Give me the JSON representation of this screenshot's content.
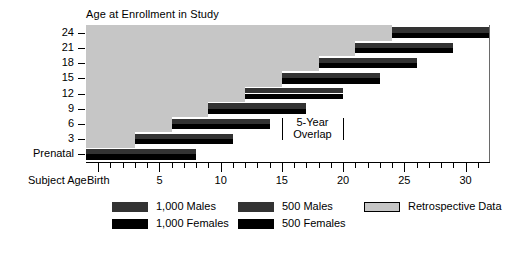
{
  "chart_data": {
    "type": "bar",
    "title": "",
    "ylabel": "Age at Enrollment in Study",
    "xlabel": "Subject Age",
    "xlim": [
      -1,
      32
    ],
    "x_major_ticks": [
      0,
      5,
      10,
      15,
      20,
      25,
      30
    ],
    "x_major_labels": [
      "Birth",
      "5",
      "10",
      "15",
      "20",
      "25",
      "30"
    ],
    "x_minor_step": 1,
    "y_categories": [
      "Prenatal",
      "3",
      "6",
      "9",
      "12",
      "15",
      "18",
      "21",
      "24"
    ],
    "grid": false,
    "legend_position": "below",
    "annotations": [
      {
        "text": "5-Year Overlap",
        "x_start": 15,
        "x_end": 20,
        "y_row": "3"
      }
    ],
    "series": [
      {
        "name": "Males",
        "color": "#333333",
        "position": "upper half of each cohort bar"
      },
      {
        "name": "Females",
        "color": "#000000",
        "position": "lower half of each cohort bar"
      },
      {
        "name": "Retrospective Data",
        "color": "#c6c6c6",
        "position": "background region left of each cohort bar"
      }
    ],
    "cohorts": [
      {
        "enrollment_age": "Prenatal",
        "age_start": -1,
        "age_end": 8,
        "n": 1000
      },
      {
        "enrollment_age": "3",
        "age_start": 3,
        "age_end": 11,
        "n": 1000
      },
      {
        "enrollment_age": "6",
        "age_start": 6,
        "age_end": 14,
        "n": 1000
      },
      {
        "enrollment_age": "9",
        "age_start": 9,
        "age_end": 17,
        "n": 1000
      },
      {
        "enrollment_age": "12",
        "age_start": 12,
        "age_end": 20,
        "n": 1000
      },
      {
        "enrollment_age": "15",
        "age_start": 15,
        "age_end": 23,
        "n": 500
      },
      {
        "enrollment_age": "18",
        "age_start": 18,
        "age_end": 26,
        "n": 500
      },
      {
        "enrollment_age": "21",
        "age_start": 21,
        "age_end": 29,
        "n": 500
      },
      {
        "enrollment_age": "24",
        "age_start": 24,
        "age_end": 32,
        "n": 500
      }
    ]
  },
  "axes": {
    "y_title": "Age at Enrollment in Study",
    "x_title": "Subject Age",
    "y_labels": [
      "24",
      "21",
      "18",
      "15",
      "12",
      "9",
      "6",
      "3",
      "Prenatal"
    ],
    "x_labels": [
      "Birth",
      "5",
      "10",
      "15",
      "20",
      "25",
      "30"
    ]
  },
  "annotation": {
    "line1": "5-Year",
    "line2": "Overlap"
  },
  "legend": {
    "items": [
      {
        "label": "1,000 Males",
        "swatch": "gray"
      },
      {
        "label": "1,000 Females",
        "swatch": "black"
      },
      {
        "label": "500 Males",
        "swatch": "gray"
      },
      {
        "label": "500 Females",
        "swatch": "black"
      },
      {
        "label": "Retrospective Data",
        "swatch": "retro"
      }
    ]
  },
  "colors": {
    "males": "#333333",
    "females": "#000000",
    "retrospective": "#c6c6c6",
    "axis": "#000000"
  }
}
